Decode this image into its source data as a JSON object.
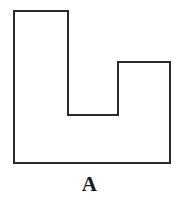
{
  "figure": {
    "label": "A",
    "shape_name": "notched-rectangle",
    "stroke_color": "#2b2b2b",
    "fill_color": "#ffffff",
    "background_color": "#ffffff",
    "stroke_width": 2,
    "vertices": [
      [
        14,
        11
      ],
      [
        68,
        11
      ],
      [
        68,
        115
      ],
      [
        118,
        115
      ],
      [
        118,
        62
      ],
      [
        170,
        62
      ],
      [
        170,
        163
      ],
      [
        14,
        163
      ]
    ],
    "points_string": "14,11 68,11 68,115 118,115 118,62 170,62 170,163 14,163"
  },
  "chart_data": {
    "type": "diagram",
    "title": "A",
    "polygon": {
      "closed": true,
      "vertex_count": 8,
      "vertices": [
        {
          "x": 14,
          "y": 11
        },
        {
          "x": 68,
          "y": 11
        },
        {
          "x": 68,
          "y": 115
        },
        {
          "x": 118,
          "y": 115
        },
        {
          "x": 118,
          "y": 62
        },
        {
          "x": 170,
          "y": 62
        },
        {
          "x": 170,
          "y": 163
        },
        {
          "x": 14,
          "y": 163
        }
      ],
      "bounding_box": {
        "x": 14,
        "y": 11,
        "width": 156,
        "height": 152
      },
      "notch": {
        "x": 68,
        "y": 62,
        "width": 50,
        "height": 53
      }
    },
    "xlabel": "",
    "ylabel": "",
    "grid": false,
    "legend": "none"
  }
}
